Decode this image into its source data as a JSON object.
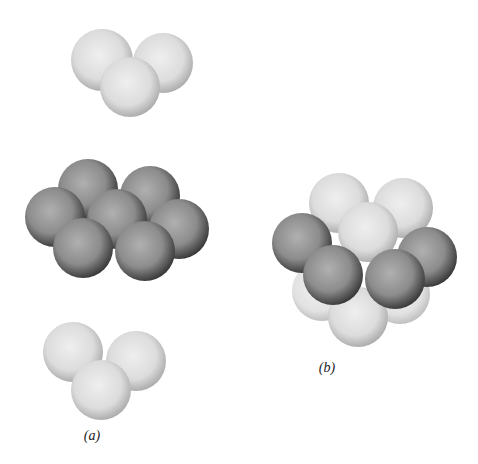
{
  "figure": {
    "panels": [
      {
        "id": "a",
        "label": "(a)",
        "description": "Exploded view of three layers",
        "layers": [
          {
            "name": "top-layer",
            "shade": "light",
            "sphere_count": 3
          },
          {
            "name": "middle-layer",
            "shade": "dark",
            "sphere_count": 7
          },
          {
            "name": "bottom-layer",
            "shade": "light",
            "sphere_count": 3
          }
        ]
      },
      {
        "id": "b",
        "label": "(b)",
        "description": "Assembled cluster",
        "layers": [
          {
            "name": "top-layer",
            "shade": "light",
            "sphere_count": 3
          },
          {
            "name": "middle-layer",
            "shade": "dark",
            "sphere_count": 4
          },
          {
            "name": "bottom-layer",
            "shade": "light",
            "sphere_count": 3
          }
        ]
      }
    ]
  },
  "colors": {
    "light_center": "#ececec",
    "light_edge": "#a8a8a8",
    "dark_center": "#a6a6a6",
    "dark_edge": "#3c3c3c",
    "background": "#ffffff"
  }
}
